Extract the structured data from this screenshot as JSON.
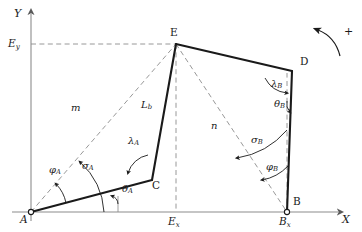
{
  "figure": {
    "type": "kinematic-linkage-diagram",
    "background_color": "#ffffff",
    "line_color": "#1a1a1a",
    "axis_color": "#8c8c8c",
    "dash_color": "#8c8c8c"
  },
  "axes": {
    "x_label": "X",
    "y_label": "Y",
    "origin_point": "A"
  },
  "points": {
    "A": {
      "label": "A",
      "x": 31,
      "y": 212
    },
    "B": {
      "label": "B",
      "x": 287,
      "y": 212
    },
    "C": {
      "label": "C",
      "x": 152,
      "y": 180
    },
    "D": {
      "label": "D",
      "x": 292,
      "y": 71
    },
    "E": {
      "label": "E",
      "x": 176,
      "y": 44
    }
  },
  "coordinate_labels": {
    "Ey": {
      "base": "E",
      "sub": "y",
      "x": 8,
      "y": 38
    },
    "Ex": {
      "base": "E",
      "sub": "x",
      "x": 168,
      "y": 217
    },
    "Bx": {
      "base": "B",
      "sub": "x",
      "x": 279,
      "y": 217
    }
  },
  "link_labels": {
    "m": {
      "base": "m",
      "sub": "",
      "x": 71,
      "y": 109
    },
    "n": {
      "base": "n",
      "sub": "",
      "x": 211,
      "y": 127
    },
    "Lb": {
      "base": "L",
      "sub": "b",
      "x": 143,
      "y": 106
    }
  },
  "angle_labels": {
    "phi_A": {
      "base": "φ",
      "sub": "A",
      "x": 49,
      "y": 170
    },
    "sigma_A": {
      "base": "σ",
      "sub": "A",
      "x": 82,
      "y": 166
    },
    "theta_A": {
      "base": "θ",
      "sub": "A",
      "x": 118,
      "y": 188
    },
    "lambda_A": {
      "base": "λ",
      "sub": "A",
      "x": 128,
      "y": 142
    },
    "lambda_B": {
      "base": "λ",
      "sub": "B",
      "x": 273,
      "y": 85
    },
    "theta_B": {
      "base": "θ",
      "sub": "B",
      "x": 276,
      "y": 104
    },
    "sigma_B": {
      "base": "σ",
      "sub": "B",
      "x": 253,
      "y": 140
    },
    "phi_B": {
      "base": "φ",
      "sub": "B",
      "x": 268,
      "y": 167
    }
  },
  "rotation_indicator": {
    "sign_label": "+",
    "sign_x": 344,
    "sign_y": 31,
    "direction": "counterclockwise"
  }
}
